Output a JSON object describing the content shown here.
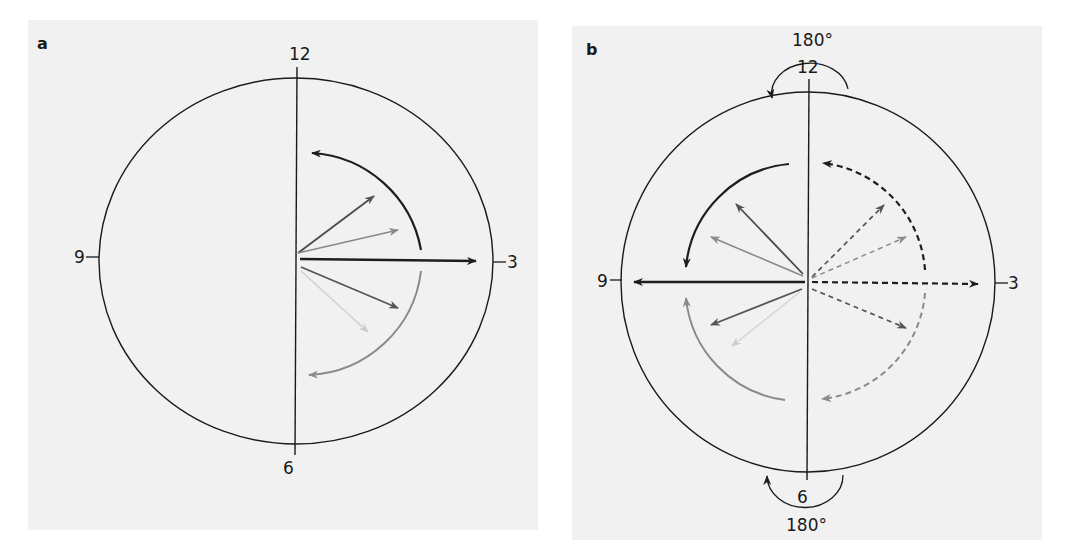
{
  "panels": [
    {
      "id": "a",
      "letter": "a",
      "clock_labels": {
        "top": "12",
        "right": "3",
        "bottom": "6",
        "left": "9"
      },
      "description": "Vectors fanning around 3 o'clock on right half only"
    },
    {
      "id": "b",
      "letter": "b",
      "clock_labels": {
        "top": "12",
        "right": "3",
        "bottom": "6",
        "left": "9"
      },
      "rotation_labels": {
        "top": "180°",
        "bottom": "180°"
      },
      "description": "Solid vectors mirrored to left half around 9 o'clock; dashed vectors on right half around 3 o'clock"
    }
  ],
  "colors": {
    "background": "#f1f1f1",
    "line": "#1a1a1a",
    "dark_arrow": "#222222",
    "mid_arrow": "#555555",
    "light_arrow": "#8c8c8c",
    "faint_arrow": "#cfcfcf"
  }
}
